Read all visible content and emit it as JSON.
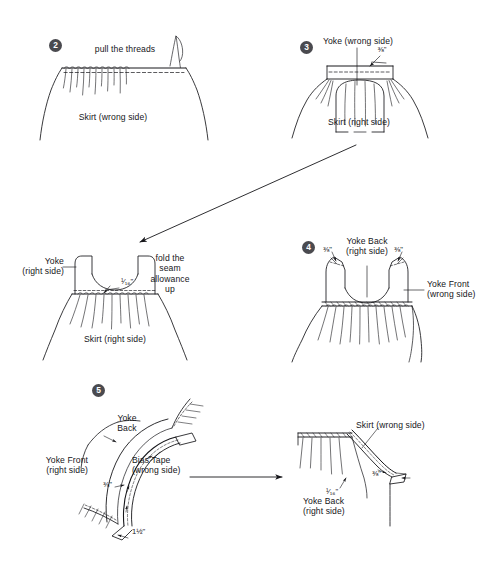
{
  "document": {
    "title": "Yoke and skirt assembly instructions",
    "kind": "sewing-illustration",
    "ink_color": "#16161a",
    "badge_color": "#4a4a4f",
    "background": "#ffffff"
  },
  "steps": [
    {
      "number": "2",
      "name": "gather-skirt",
      "labels": [
        {
          "name": "instruction",
          "text": "pull the threads"
        },
        {
          "name": "piece-skirt",
          "text": "Skirt (wrong side)"
        }
      ],
      "measurements": []
    },
    {
      "number": "3",
      "name": "attach-yoke",
      "labels": [
        {
          "name": "piece-yoke",
          "text": "Yoke (wrong side)"
        },
        {
          "name": "piece-skirt",
          "text": "Skirt (right side)"
        }
      ],
      "measurements": [
        {
          "name": "seam-allowance",
          "text": "⅜\""
        }
      ]
    },
    {
      "number": "",
      "name": "fold-seam-allowance",
      "labels": [
        {
          "name": "piece-yoke",
          "text": "Yoke\n(right side)"
        },
        {
          "name": "instruction",
          "text": "fold the\nseam\nallowance\nup"
        },
        {
          "name": "piece-skirt",
          "text": "Skirt (right side)"
        }
      ],
      "measurements": [
        {
          "name": "topstitch-allowance",
          "text": "¹⁄₁₆\""
        }
      ]
    },
    {
      "number": "4",
      "name": "join-shoulders",
      "labels": [
        {
          "name": "piece-yoke-back",
          "text": "Yoke Back\n(right side)"
        },
        {
          "name": "piece-yoke-front",
          "text": "Yoke Front\n(wrong side)"
        }
      ],
      "measurements": [
        {
          "name": "shoulder-seam-left",
          "text": "⅜\""
        },
        {
          "name": "shoulder-seam-right",
          "text": "⅜\""
        }
      ]
    },
    {
      "number": "5",
      "name": "apply-bias-tape",
      "labels": [
        {
          "name": "piece-yoke-back",
          "text": "Yoke\nBack"
        },
        {
          "name": "piece-yoke-front",
          "text": "Yoke Front\n(right side)"
        },
        {
          "name": "piece-bias-tape",
          "text": "Bias Tape\n(wrong side)"
        }
      ],
      "measurements": [
        {
          "name": "bias-seam-allowance",
          "text": "⅜\""
        },
        {
          "name": "bias-tape-tail",
          "text": "1½\""
        }
      ]
    },
    {
      "number": "",
      "name": "bias-tape-finished",
      "labels": [
        {
          "name": "piece-skirt",
          "text": "Skirt (wrong side)"
        },
        {
          "name": "piece-yoke-back",
          "text": "Yoke Back\n(right side)"
        }
      ],
      "measurements": [
        {
          "name": "bias-seam-allowance",
          "text": "⅜\""
        },
        {
          "name": "topstitch-allowance",
          "text": "¹⁄₁₆\""
        }
      ]
    }
  ],
  "connectors": [
    {
      "name": "arrow-step3-to-fold",
      "direction": "diagonal-down-left"
    },
    {
      "name": "arrow-step5-to-finished",
      "direction": "right"
    }
  ]
}
